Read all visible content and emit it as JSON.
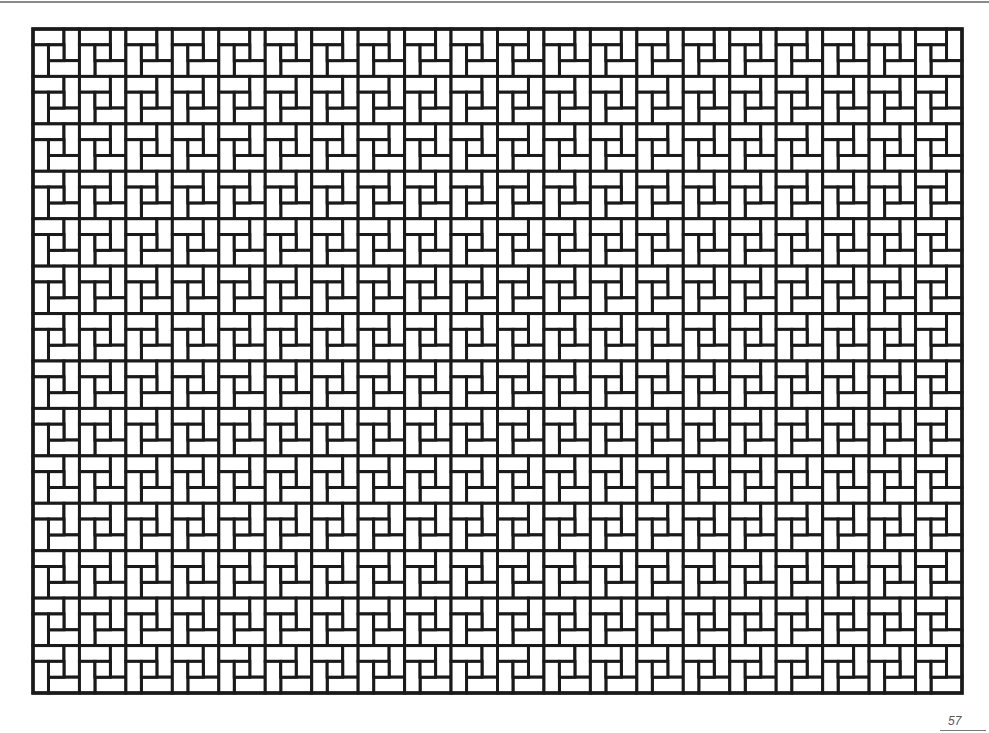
{
  "page": {
    "page_number": "57"
  },
  "pattern": {
    "name": "pinwheel-basketweave",
    "columns": 20,
    "rows": 14,
    "origin_x": 33,
    "origin_y": 29,
    "width": 929,
    "height": 664,
    "stroke_color": "#1a1a1a",
    "stroke_width": 3,
    "fill_color": "#ffffff"
  },
  "colors": {
    "background": "#ffffff",
    "rule": "#8a8a8a",
    "page_number": "#555555"
  }
}
